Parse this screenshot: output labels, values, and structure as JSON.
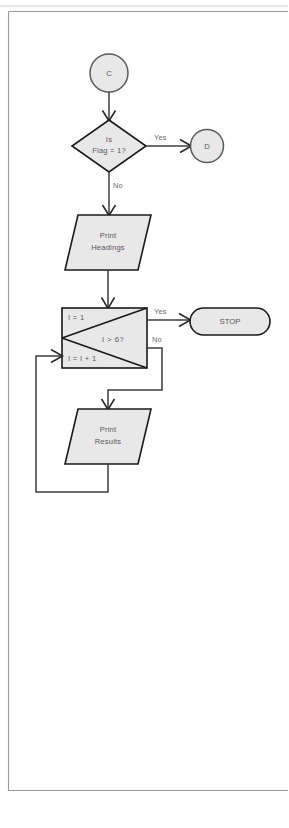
{
  "diagram": {
    "colors": {
      "node_fill": "#e8e8e8",
      "node_stroke": "#1a1a1a",
      "line": "#3c3c3c",
      "text": "#585858",
      "page_border": "#9a9a9a",
      "background": "#ffffff"
    },
    "nodes": {
      "connector_in": {
        "label": "C",
        "shape": "circle"
      },
      "decision_flag": {
        "line1": "Is",
        "line2": "Flag = 1?",
        "shape": "diamond"
      },
      "connector_out": {
        "label": "D",
        "shape": "circle"
      },
      "print_headings": {
        "line1": "Print",
        "line2": "Headings",
        "shape": "parallelogram"
      },
      "loop_box": {
        "init": "I = 1",
        "condition": "I > 6?",
        "increment": "I = I + 1",
        "shape": "loop-limit"
      },
      "stop": {
        "label": "STOP",
        "shape": "stadium"
      },
      "print_results": {
        "line1": "Print",
        "line2": "Results",
        "shape": "parallelogram"
      }
    },
    "edge_labels": {
      "decision_yes": "Yes",
      "decision_no": "No",
      "loop_yes": "Yes",
      "loop_no": "No"
    }
  }
}
